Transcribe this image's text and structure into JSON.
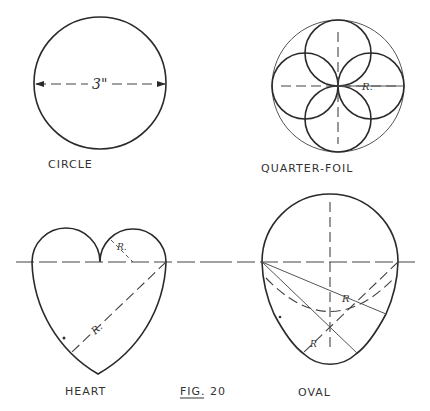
{
  "figure": {
    "caption": "FIG. 20",
    "background": "#ffffff",
    "ink_color": "#2a2a2a"
  },
  "shapes": [
    {
      "id": "circle",
      "label": "CIRCLE",
      "dimension": "3\""
    },
    {
      "id": "quarter-foil",
      "label": "QUARTER-FOIL",
      "dimension": "R."
    },
    {
      "id": "heart",
      "label": "HEART",
      "dimension_small": "R.",
      "dimension_large": "R."
    },
    {
      "id": "oval",
      "label": "OVAL",
      "dimension_large": "R",
      "dimension_small": "R"
    }
  ]
}
